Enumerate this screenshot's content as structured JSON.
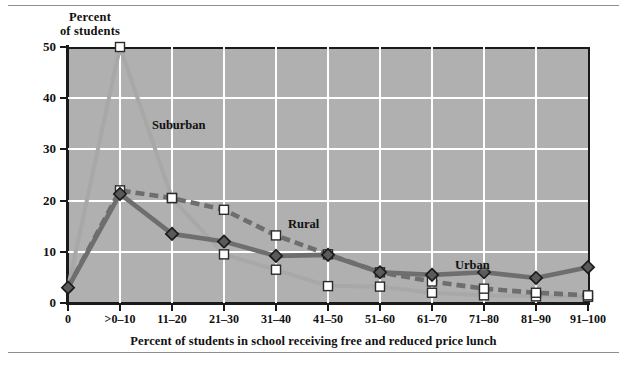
{
  "figure": {
    "y_axis_title_line1": "Percent",
    "y_axis_title_line2": "of students",
    "x_axis_title": "Percent of students in school receiving free and reduced price lunch",
    "y_ticks": [
      "0",
      "10",
      "20",
      "30",
      "40",
      "50"
    ],
    "series_labels": {
      "suburban": "Suburban",
      "rural": "Rural",
      "urban": "Urban"
    },
    "colors": {
      "plot_background": "#b0b0b0",
      "gridline": "#ffffff",
      "axis": "#1a1a1a",
      "suburban_line": "#a8a8a8",
      "rural_line": "#6e6e6e",
      "urban_line": "#6e6e6e",
      "marker_square_fill": "#ffffff",
      "marker_diamond_fill": "#5a5a5a",
      "rule": "#8d8d8d"
    }
  },
  "chart_data": {
    "type": "line",
    "title": "",
    "xlabel": "Percent of students in school receiving free and reduced price lunch",
    "ylabel": "Percent of students",
    "ylim": [
      0,
      50
    ],
    "yticks": [
      0,
      10,
      20,
      30,
      40,
      50
    ],
    "grid": true,
    "legend": "inline-annotations",
    "categories": [
      "0",
      ">0–10",
      "11–20",
      "21–30",
      "31–40",
      "41–50",
      "51–60",
      "61–70",
      "71–80",
      "81–90",
      "91–100"
    ],
    "series": [
      {
        "name": "Suburban",
        "marker": "open-square",
        "line_style": "solid",
        "color": "#a8a8a8",
        "values": [
          3,
          50,
          20.5,
          9.5,
          6.5,
          3.3,
          3.2,
          2.0,
          1.5,
          1.3,
          1.2
        ]
      },
      {
        "name": "Rural",
        "marker": "open-square",
        "line_style": "dashed",
        "color": "#6e6e6e",
        "values": [
          3,
          22,
          20.5,
          18.2,
          13.2,
          9.5,
          6.0,
          4.2,
          2.8,
          2.0,
          1.5
        ]
      },
      {
        "name": "Urban",
        "marker": "filled-diamond",
        "line_style": "solid",
        "color": "#6e6e6e",
        "values": [
          3,
          21.3,
          13.5,
          12.0,
          9.2,
          9.4,
          6.0,
          5.5,
          6.0,
          4.9,
          7.0
        ]
      }
    ]
  }
}
